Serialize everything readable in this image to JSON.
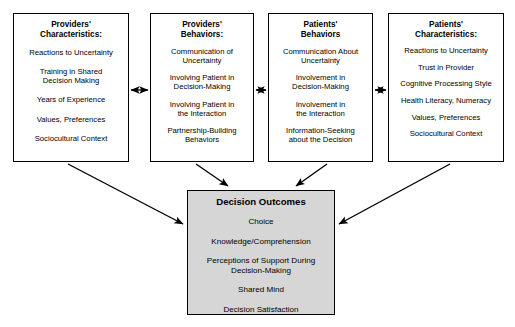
{
  "diagram": {
    "boxes": [
      {
        "id": "providers-characteristics",
        "title": "Providers'\nCharacteristics:",
        "items": [
          "Reactions to Uncertainty",
          "Training in Shared\nDecision Making",
          "Years of Experience",
          "Values, Preferences",
          "Sociocultural Context"
        ]
      },
      {
        "id": "providers-behaviors",
        "title": "Providers'\nBehaviors:",
        "items": [
          "Communication of\nUncertainty",
          "Involving Patient in\nDecision-Making",
          "Involving Patient in\nthe Interaction",
          "Partnership-Building\nBehaviors"
        ]
      },
      {
        "id": "patients-behaviors",
        "title": "Patients'\nBehaviors",
        "items": [
          "Communication About\nUncertainty",
          "Involvement in\nDecision-Making",
          "Involvement in\nthe Interaction",
          "Information-Seeking\nabout the Decision"
        ]
      },
      {
        "id": "patients-characteristics",
        "title": "Patients'\nCharacteristics:",
        "items": [
          "Reactions to Uncertainty",
          "Trust in Provider",
          "Cognitive Processing Style",
          "Health Literacy, Numeracy",
          "Values, Preferences",
          "Sociocultural Context"
        ]
      }
    ],
    "outcomes": {
      "id": "decision-outcomes",
      "title": "Decision Outcomes",
      "items": [
        "Choice",
        "Knowledge/Comprehension",
        "Perceptions of Support During\nDecision-Making",
        "Shared Mind",
        "Decision Satisfaction"
      ]
    },
    "colors": {
      "outline": "#000000",
      "outcomes_fill": "#d6d6d6",
      "background": "#ffffff",
      "text": "#000000"
    }
  }
}
